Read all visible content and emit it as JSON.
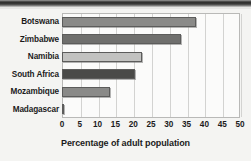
{
  "chart_data": {
    "type": "bar",
    "orientation": "horizontal",
    "title": "",
    "xlabel": "Percentage of adult population",
    "ylabel": "",
    "categories": [
      "Botswana",
      "Zimbabwe",
      "Namibia",
      "South Africa",
      "Mozambique",
      "Madagascar"
    ],
    "values": [
      37.5,
      33.5,
      22.5,
      20.5,
      13.5,
      0.5
    ],
    "bar_colors": [
      "#8a8a88",
      "#6f6f6d",
      "#c2c2c0",
      "#4a4a48",
      "#8a8a88",
      "#8a8a88"
    ],
    "xlim": [
      0,
      50
    ],
    "xticks": [
      0,
      5,
      10,
      15,
      20,
      25,
      30,
      35,
      40,
      45,
      50
    ],
    "xtick_labels": [
      "0",
      "5",
      "10",
      "15",
      "20",
      "25",
      "30",
      "35",
      "40",
      "45",
      "50"
    ],
    "grid": true,
    "grid_axis": "x",
    "legend": null
  },
  "figure": {
    "background_color": "#f4f4f2",
    "plot_background_color": "#fbfbfa",
    "frame_color": "#b9b9b7",
    "grid_color": "#d3d3d1",
    "text_color": "#1b1b1b"
  }
}
